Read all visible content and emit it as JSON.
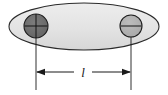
{
  "figure": {
    "background_color": "#ffffff",
    "width": 168,
    "height": 95
  },
  "body_shape": {
    "name": "ellipse-body",
    "fill_color": "#e2e2e2",
    "stroke_color": "#2b2b2b",
    "center_x": 84,
    "center_y": 26,
    "radius_x": 76,
    "radius_y": 24
  },
  "masses": [
    {
      "name": "left-mass",
      "fill_color": "#6e6e6e",
      "stroke_color": "#1f1f1f",
      "center_x": 36,
      "center_y": 26,
      "radius": 12,
      "has_vertical_axis": true,
      "has_horizontal_axis": true
    },
    {
      "name": "right-mass",
      "fill_color": "#b2b2b2",
      "stroke_color": "#1f1f1f",
      "center_x": 131,
      "center_y": 26,
      "radius": 11,
      "has_vertical_axis": false,
      "has_horizontal_axis": true
    }
  ],
  "dimension": {
    "label": "l",
    "label_x": 83,
    "label_y": 76,
    "line_y": 72,
    "left_x": 36,
    "right_x": 131,
    "stroke_color": "#1a1a1a",
    "extension_top_left_y": 18,
    "extension_top_right_y": 20,
    "extension_bottom_y": 90,
    "arrow_size": 6
  },
  "colors": {
    "ink": "#1a1a1a",
    "body_fill": "#e2e2e2",
    "left_mass_fill": "#6e6e6e",
    "right_mass_fill": "#b2b2b2",
    "paper": "#ffffff"
  }
}
